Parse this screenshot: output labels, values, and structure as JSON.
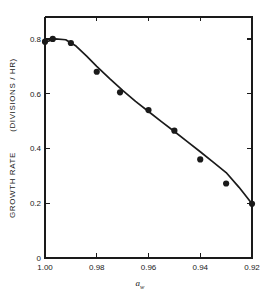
{
  "figure": {
    "background_color": "#ffffff",
    "ink_color": "#1a1a1a"
  },
  "chart_data": {
    "type": "scatter",
    "title": "",
    "subtitle": "",
    "xlabel": "a_w",
    "xlabel_symbol": "a",
    "xlabel_subscript": "w",
    "ylabel": "GROWTH RATE   (DIVISIONS / HR)",
    "ylabel_part1": "GROWTH  RATE",
    "ylabel_part2": "(DIVISIONS / HR)",
    "xlim": [
      1.0,
      0.92
    ],
    "ylim": [
      0,
      0.88
    ],
    "x_axis_inverted": true,
    "xticks": [
      1.0,
      0.98,
      0.96,
      0.94,
      0.92
    ],
    "xticklabels": [
      "1.00",
      "0.98",
      "0.96",
      "0.94",
      "0.92"
    ],
    "yticks": [
      0,
      0.2,
      0.4,
      0.6,
      0.8
    ],
    "yticklabels": [
      "0",
      "0.2",
      "0.4",
      "0.6",
      "0.8"
    ],
    "grid": false,
    "legend": false,
    "legend_position": "none",
    "marker": "filled-circle",
    "series": [
      {
        "name": "growth rate vs water activity",
        "x": [
          1.0,
          0.997,
          0.99,
          0.98,
          0.971,
          0.96,
          0.95,
          0.94,
          0.93,
          0.92
        ],
        "y": [
          0.79,
          0.8,
          0.785,
          0.68,
          0.605,
          0.54,
          0.465,
          0.36,
          0.272,
          0.198
        ]
      }
    ],
    "fit_curve": {
      "name": "fitted curve",
      "x": [
        1.0,
        0.996,
        0.992,
        0.988,
        0.984,
        0.98,
        0.975,
        0.97,
        0.965,
        0.96,
        0.955,
        0.95,
        0.945,
        0.94,
        0.935,
        0.93,
        0.925,
        0.92
      ],
      "y": [
        0.788,
        0.8,
        0.797,
        0.774,
        0.738,
        0.7,
        0.655,
        0.612,
        0.572,
        0.535,
        0.498,
        0.462,
        0.425,
        0.388,
        0.35,
        0.312,
        0.258,
        0.198
      ]
    }
  }
}
